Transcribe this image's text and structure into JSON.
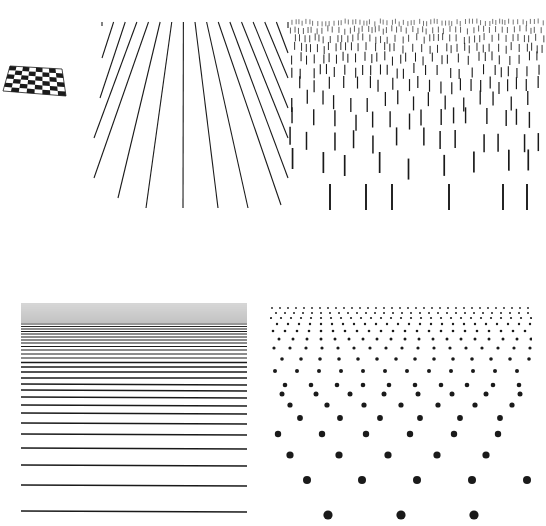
{
  "figure": {
    "background": "#ffffff",
    "ink": "#1a1a1a",
    "panels": [
      {
        "id": "checkerboard",
        "kind": "perspective-checkerboard",
        "box": {
          "x": 0,
          "y": 60,
          "w": 70,
          "h": 40
        },
        "cols": 8,
        "rows": 6,
        "quad": {
          "tl": [
            10,
            6
          ],
          "tr": [
            62,
            9
          ],
          "br": [
            66,
            36
          ],
          "bl": [
            3,
            31
          ]
        }
      },
      {
        "id": "radiating-lines",
        "kind": "converging-lines",
        "box": {
          "x": 88,
          "y": 18,
          "w": 206,
          "h": 195
        },
        "top_y": 4,
        "count": 17,
        "top_x_start": 14,
        "top_x_end": 200,
        "bottom_points": [
          [
            14,
            8
          ],
          [
            14,
            40
          ],
          [
            12,
            80
          ],
          [
            6,
            120
          ],
          [
            6,
            160
          ],
          [
            30,
            180
          ],
          [
            58,
            190
          ],
          [
            95,
            190
          ],
          [
            130,
            190
          ],
          [
            160,
            190
          ],
          [
            193,
            187
          ],
          [
            200,
            160
          ],
          [
            200,
            120
          ],
          [
            200,
            90
          ],
          [
            200,
            60
          ],
          [
            200,
            35
          ],
          [
            200,
            10
          ]
        ]
      },
      {
        "id": "vertical-dashes",
        "kind": "dash-texture",
        "box": {
          "x": 288,
          "y": 14,
          "w": 258,
          "h": 202
        },
        "rows": [
          {
            "y": 6,
            "len": 5,
            "spacing": 4,
            "w": 0.6
          },
          {
            "y": 13,
            "len": 6,
            "spacing": 5,
            "w": 0.7
          },
          {
            "y": 21,
            "len": 7,
            "spacing": 6,
            "w": 0.8
          },
          {
            "y": 30,
            "len": 8,
            "spacing": 7,
            "w": 0.9
          },
          {
            "y": 40,
            "len": 9,
            "spacing": 8,
            "w": 1.0
          },
          {
            "y": 52,
            "len": 10,
            "spacing": 10,
            "w": 1.1
          },
          {
            "y": 65,
            "len": 12,
            "spacing": 12,
            "w": 1.2
          },
          {
            "y": 80,
            "len": 14,
            "spacing": 14,
            "w": 1.3
          },
          {
            "y": 97,
            "len": 16,
            "spacing": 17,
            "w": 1.4
          },
          {
            "y": 117,
            "len": 18,
            "spacing": 21,
            "w": 1.5
          },
          {
            "y": 140,
            "len": 21,
            "spacing": 26,
            "w": 1.7
          },
          {
            "y": 170,
            "len": 26,
            "spacing": 36,
            "w": 1.9
          }
        ],
        "last_row_x": [
          42,
          78,
          104,
          161,
          215,
          239
        ]
      },
      {
        "id": "horizontal-lines",
        "kind": "receding-horizontal-lines",
        "box": {
          "x": 20,
          "y": 300,
          "w": 230,
          "h": 215
        },
        "x1": 1,
        "x2": 227,
        "line_y": [
          4,
          6,
          8,
          10,
          12,
          14,
          16,
          18,
          20,
          22,
          24,
          26.5,
          29,
          31.5,
          34,
          37,
          40,
          43,
          46.5,
          50,
          54,
          58,
          62.5,
          67,
          72,
          78,
          84,
          90,
          97,
          105,
          113,
          123,
          134,
          148,
          165,
          185,
          211
        ],
        "stroke_widths": [
          0.6,
          1.7
        ]
      },
      {
        "id": "dot-grid",
        "kind": "perspective-dot-lattice",
        "box": {
          "x": 270,
          "y": 296,
          "w": 262,
          "h": 230
        },
        "rows": [
          {
            "y": 12,
            "r": 0.9,
            "spacing": 8,
            "offset": 2
          },
          {
            "y": 17,
            "r": 1.0,
            "spacing": 9,
            "offset": 6
          },
          {
            "y": 22,
            "r": 1.1,
            "spacing": 10,
            "offset": 1
          },
          {
            "y": 28,
            "r": 1.2,
            "spacing": 11,
            "offset": 7
          },
          {
            "y": 35,
            "r": 1.3,
            "spacing": 12,
            "offset": 3
          },
          {
            "y": 43,
            "r": 1.5,
            "spacing": 14,
            "offset": 9
          },
          {
            "y": 52,
            "r": 1.6,
            "spacing": 16,
            "offset": 4
          },
          {
            "y": 63,
            "r": 1.8,
            "spacing": 19,
            "offset": 12
          },
          {
            "y": 75,
            "r": 2.0,
            "spacing": 22,
            "offset": 5
          },
          {
            "y": 89,
            "r": 2.3,
            "spacing": 26,
            "offset": 15
          },
          {
            "y": 98,
            "r": 2.5,
            "spacing": 34,
            "offset": 12
          },
          {
            "y": 109,
            "r": 2.6,
            "spacing": 37,
            "offset": 20
          },
          {
            "y": 122,
            "r": 2.9,
            "spacing": 40,
            "offset": 30
          },
          {
            "y": 138,
            "r": 3.2,
            "spacing": 44,
            "offset": 8
          },
          {
            "y": 159,
            "r": 3.6,
            "spacing": 49,
            "offset": 20
          },
          {
            "y": 184,
            "r": 4.0,
            "spacing": 55,
            "offset": 37
          },
          {
            "y": 219,
            "r": 4.6,
            "spacing": 73,
            "offset": 58
          }
        ]
      }
    ]
  }
}
